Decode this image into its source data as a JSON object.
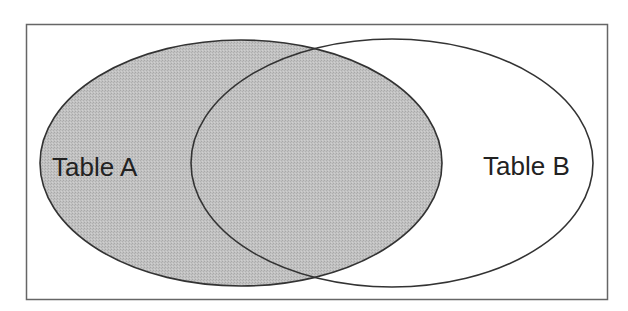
{
  "diagram": {
    "type": "venn",
    "sets": [
      {
        "id": "A",
        "label": "Table A",
        "shaded": true
      },
      {
        "id": "B",
        "label": "Table B",
        "shaded": false
      }
    ],
    "highlighted_region": "A",
    "colors": {
      "shaded_fill": "#bdbdbd",
      "outline": "#333333",
      "frame": "#666666",
      "background": "#ffffff"
    }
  }
}
